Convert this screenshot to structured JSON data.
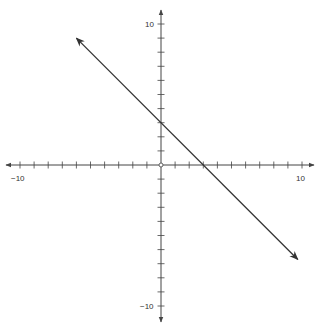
{
  "chart_data": {
    "type": "line",
    "title": "",
    "xlabel": "",
    "ylabel": "",
    "xlim": [
      -10,
      10
    ],
    "ylim": [
      -10,
      10
    ],
    "grid": false,
    "tick_step": 1,
    "tick_labels": {
      "x_min": "−10",
      "x_max": "10",
      "y_max": "10",
      "y_min": "−10"
    },
    "series": [
      {
        "name": "line",
        "equation": "y = -x + 3",
        "slope": -1,
        "intercept": 3,
        "x": [
          -6,
          9.7
        ],
        "y": [
          9,
          -6.7
        ],
        "arrows_both_ends": true,
        "color": "#333333"
      }
    ],
    "origin_marker": "open-circle"
  },
  "colors": {
    "axis": "#444444",
    "line": "#333333",
    "background": "#ffffff"
  }
}
